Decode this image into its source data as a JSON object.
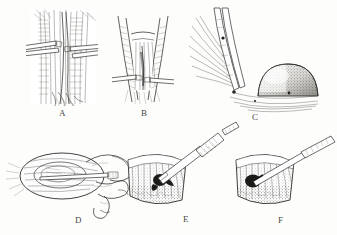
{
  "plate": {
    "title": "Operative technique plate",
    "style": "pen-and-ink medical line engraving",
    "background_color": "#fdfdfb",
    "ink_color": "#2e2e2c",
    "panel_count": 6
  },
  "panels": [
    {
      "id": "A",
      "label": "A",
      "label_x": 62,
      "label_y": 113,
      "caption": "Longitudinal exposure of fibrous tissue plane held open by two retractors",
      "subject": "vertical muscle and fascial fibers with paired retractors",
      "instruments": [
        "retractor",
        "retractor"
      ]
    },
    {
      "id": "B",
      "label": "B",
      "label_x": 144,
      "label_y": 113,
      "caption": "V-shaped incision opened with lateral retraction of the wound edges",
      "subject": "wedge-shaped incision with everted edges",
      "instruments": [
        "retractor",
        "retractor"
      ]
    },
    {
      "id": "C",
      "label": "C",
      "label_x": 256,
      "label_y": 118,
      "caption": "Forceps elevating fibre bundle beside a rounded stippled mass",
      "subject": "grasping forceps, fibre fan and domed lesion",
      "instruments": [
        "forceps"
      ]
    },
    {
      "id": "D",
      "label": "D",
      "label_x": 78,
      "label_y": 222,
      "caption": "Gloved hand steadying the oval specimen while the probe is advanced",
      "subject": "hand holding instrument over lens-shaped structure",
      "instruments": [
        "probe",
        "gloved hand"
      ]
    },
    {
      "id": "E",
      "label": "E",
      "label_x": 186,
      "label_y": 221,
      "caption": "Scalpel incising the fan-shaped tissue over the dark lesion",
      "subject": "wedge of striated tissue with dark focus",
      "instruments": [
        "scalpel"
      ]
    },
    {
      "id": "F",
      "label": "F",
      "label_x": 281,
      "label_y": 222,
      "caption": "Fine probe introduced into the lesion cavity",
      "subject": "wedge of striated tissue with dark focus",
      "instruments": [
        "fine probe"
      ]
    }
  ]
}
